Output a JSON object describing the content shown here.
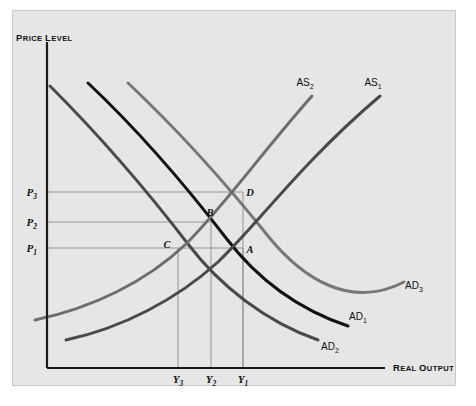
{
  "figure": {
    "background_color": "#ffffff",
    "panel_color": "#e6e6e6",
    "panel_border_color": "#c9c9c9"
  },
  "axes": {
    "y_label": "PRICE LEVEL",
    "y_label_caps_first": "P",
    "y_label_caps_rest": "RICE ",
    "y_label_caps_first2": "L",
    "y_label_caps_rest2": "EVEL",
    "x_label": "REAL OUTPUT",
    "x_label_caps_first": "R",
    "x_label_caps_rest": "EAL ",
    "x_label_caps_first2": "O",
    "x_label_caps_rest2": "UTPUT",
    "axis_color": "#1a1a1a",
    "origin_x": 47,
    "origin_y": 368,
    "y_axis_top": 42,
    "x_axis_right": 385
  },
  "price_ticks": [
    {
      "base": "P",
      "sub": "3",
      "y": 192,
      "guide_to_x": 243
    },
    {
      "base": "P",
      "sub": "2",
      "y": 222,
      "guide_to_x": 211
    },
    {
      "base": "P",
      "sub": "1",
      "y": 248,
      "guide_to_x": 243
    }
  ],
  "output_ticks": [
    {
      "base": "Y",
      "sub": "3",
      "x": 178
    },
    {
      "base": "Y",
      "sub": "2",
      "x": 211
    },
    {
      "base": "Y",
      "sub": "1",
      "x": 243
    }
  ],
  "equilibrium_points": [
    {
      "label": "A",
      "x": 243,
      "y": 248,
      "label_dx": 7,
      "label_dy": 5
    },
    {
      "label": "B",
      "x": 211,
      "y": 222,
      "label_dx": -1,
      "label_dy": -6
    },
    {
      "label": "C",
      "x": 178,
      "y": 248,
      "label_dx": -11,
      "label_dy": 0
    },
    {
      "label": "D",
      "x": 243,
      "y": 192,
      "label_dx": 7,
      "label_dy": 4
    }
  ],
  "curves": [
    {
      "name": "AD1",
      "base": "AD",
      "sub": "1",
      "color": "#101010",
      "width": 3.0,
      "label_x": 358,
      "label_y": 320,
      "path": "M 88,83 C 140,132 186,186 226,238 C 258,280 300,310 348,326"
    },
    {
      "name": "AD2",
      "base": "AD",
      "sub": "2",
      "color": "#4a4a4a",
      "width": 3.0,
      "label_x": 330,
      "label_y": 350,
      "path": "M 50,86 C 100,136 148,192 188,244 C 220,286 266,322 318,340"
    },
    {
      "name": "AD3",
      "base": "AD",
      "sub": "3",
      "color": "#777777",
      "width": 3.0,
      "label_x": 414,
      "label_y": 289,
      "path": "M 128,83 C 180,132 228,186 268,236 C 302,278 350,310 404,282"
    },
    {
      "name": "AS1",
      "base": "AS",
      "sub": "1",
      "color": "#4a4a4a",
      "width": 3.0,
      "label_x": 373,
      "label_y": 86,
      "path": "M 66,340 C 122,328 176,300 218,262 C 258,224 300,164 380,96"
    },
    {
      "name": "AS2",
      "base": "AS",
      "sub": "2",
      "color": "#6e6e6e",
      "width": 3.0,
      "label_x": 305,
      "label_y": 86,
      "path": "M 35,320 C 92,308 146,282 186,244 C 224,206 264,150 312,96"
    }
  ],
  "guide_lines": {
    "color": "#8c8c8c",
    "width": 0.9
  }
}
